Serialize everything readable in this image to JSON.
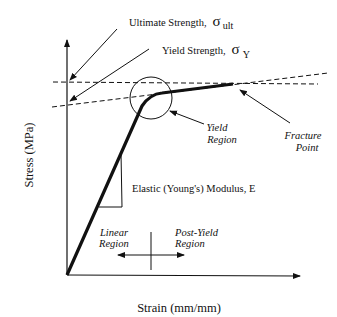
{
  "diagram": {
    "axes": {
      "x_label": "Strain (mm/mm)",
      "y_label": "Stress (MPa)"
    },
    "annotations": {
      "ultimate_strength": "Ultimate Strength,",
      "ultimate_symbol": "σ",
      "ultimate_subscript": "ult",
      "yield_strength": "Yield Strength,",
      "yield_symbol": "σ",
      "yield_subscript": "Y",
      "yield_region_line1": "Yield",
      "yield_region_line2": "Region",
      "fracture_point_line1": "Fracture",
      "fracture_point_line2": "Point",
      "elastic_modulus": "Elastic (Young's) Modulus, E",
      "linear_region_line1": "Linear",
      "linear_region_line2": "Region",
      "post_yield_line1": "Post-Yield",
      "post_yield_line2": "Region"
    },
    "colors": {
      "line": "#111111",
      "background": "#ffffff"
    }
  }
}
